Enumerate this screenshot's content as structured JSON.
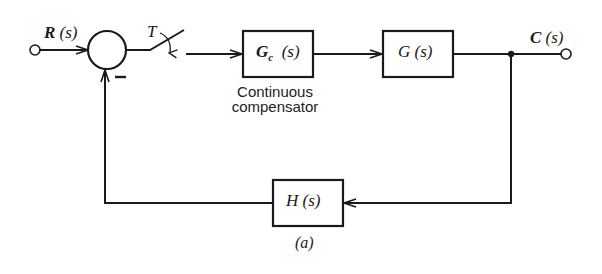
{
  "diagram": {
    "type": "block-diagram",
    "input": {
      "symbol": "R",
      "arg": "(s)"
    },
    "output": {
      "symbol": "C",
      "arg": "(s)"
    },
    "sampler": {
      "label": "T"
    },
    "summing_junction": {
      "feedback_sign": "–"
    },
    "blocks": [
      {
        "id": "compensator",
        "symbol": "G",
        "subscript": "c",
        "arg": "(s)",
        "caption_line1": "Continuous",
        "caption_line2": "compensator"
      },
      {
        "id": "plant",
        "symbol": "G",
        "arg": "(s)"
      },
      {
        "id": "feedback",
        "symbol": "H",
        "arg": "(s)"
      }
    ],
    "figure_label": "(a)",
    "line_color": "#1a1a1a"
  }
}
